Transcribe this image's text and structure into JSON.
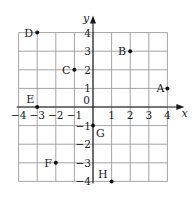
{
  "chart_data": {
    "type": "scatter",
    "title": "",
    "xlabel": "x",
    "ylabel": "y",
    "xlim": [
      -4,
      4
    ],
    "ylim": [
      -4,
      4
    ],
    "grid": true,
    "x_ticks": [
      -4,
      -3,
      -2,
      -1,
      1,
      2,
      3,
      4
    ],
    "y_ticks": [
      4,
      3,
      2,
      1,
      -1,
      -2,
      -3,
      -4
    ],
    "origin_label": "0",
    "points": [
      {
        "label": "A",
        "x": 4,
        "y": 1
      },
      {
        "label": "B",
        "x": 2,
        "y": 3
      },
      {
        "label": "C",
        "x": -1,
        "y": 2
      },
      {
        "label": "D",
        "x": -3,
        "y": 4
      },
      {
        "label": "E",
        "x": -3,
        "y": 0
      },
      {
        "label": "F",
        "x": -2,
        "y": -3
      },
      {
        "label": "G",
        "x": 0,
        "y": -1
      },
      {
        "label": "H",
        "x": 1,
        "y": -4
      }
    ]
  },
  "colors": {
    "grid": "#9a9a9a",
    "axis": "#1a1a1a",
    "point": "#111111",
    "background": "#ffffff"
  }
}
